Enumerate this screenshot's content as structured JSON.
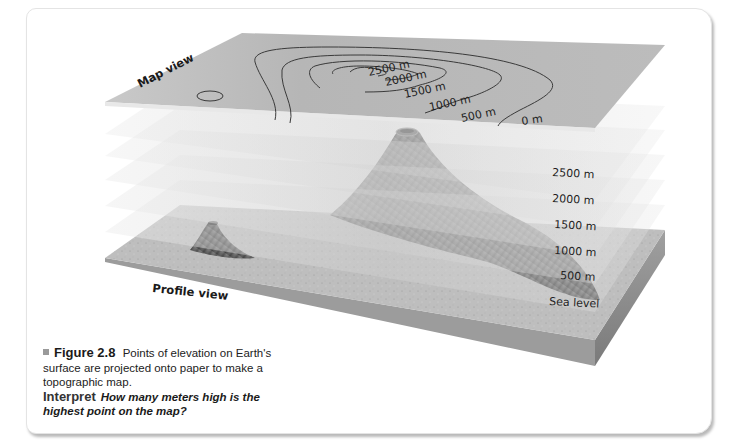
{
  "figure": {
    "number_label": "Figure 2.8",
    "caption_text": "Points of elevation on Earth's surface are projected onto paper to make a topographic map.",
    "interpret_label": "Interpret",
    "interpret_question": "How many meters high is the highest point on the map?"
  },
  "diagram": {
    "map_view_label": "Map view",
    "profile_view_label": "Profile view",
    "contour_labels": [
      "2500 m",
      "2000 m",
      "1500 m",
      "1000 m",
      "500 m",
      "0 m"
    ],
    "elevation_layers": [
      "2500 m",
      "2000 m",
      "1500 m",
      "1000 m",
      "500 m",
      "Sea level"
    ],
    "colors": {
      "map_plane": "#b9b9b9",
      "map_plane_light": "#cdcdcd",
      "layer_plane": "#d6d6d6",
      "ground": "#bdbdbd",
      "slab_side": "#8f8f8f",
      "volcano_dark": "#5a5a5a",
      "contour_line": "#3a3a3a"
    }
  }
}
